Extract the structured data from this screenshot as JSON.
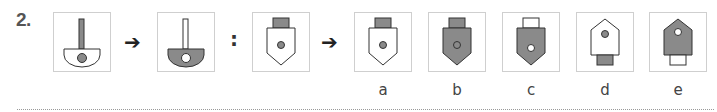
{
  "question": {
    "number": "2.",
    "relation_symbol": ":",
    "arrow_glyph": "➔"
  },
  "colors": {
    "fill_gray": "#8a8a8a",
    "stroke": "#333333",
    "box_border": "#cfcfcf"
  },
  "figures": [
    {
      "id": "fig1",
      "shape": "key-handle",
      "body_fill": "white",
      "stem_fill": "gray",
      "dot_fill": "gray"
    },
    {
      "id": "fig2",
      "shape": "key-handle",
      "body_fill": "gray",
      "stem_fill": "white",
      "dot_fill": "white"
    },
    {
      "id": "fig3",
      "shape": "pentagon-plug-down",
      "body_fill": "white",
      "cap_fill": "gray",
      "dot_fill": "gray"
    }
  ],
  "options": [
    {
      "label": "a",
      "shape": "pentagon-plug-down",
      "body_fill": "white",
      "cap_fill": "gray",
      "dot_fill": "gray"
    },
    {
      "label": "b",
      "shape": "pentagon-plug-down",
      "body_fill": "gray",
      "cap_fill": "gray",
      "dot_fill": "gray-ring"
    },
    {
      "label": "c",
      "shape": "pentagon-plug-down",
      "body_fill": "gray",
      "cap_fill": "white",
      "dot_fill": "white"
    },
    {
      "label": "d",
      "shape": "pentagon-plug-up",
      "body_fill": "white",
      "cap_fill": "gray",
      "dot_fill": "gray"
    },
    {
      "label": "e",
      "shape": "pentagon-plug-up",
      "body_fill": "gray",
      "cap_fill": "white",
      "dot_fill": "white"
    }
  ]
}
